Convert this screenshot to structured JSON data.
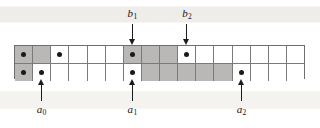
{
  "figure": {
    "name": "two-row-cell-array-with-pointers",
    "grid": {
      "columns": 16,
      "rows": 2,
      "shade_color": "#b9b8b6",
      "cell_color": "#ffffff",
      "border_color": "#6e6e6e",
      "dot_color": "#1a1a1a",
      "top_row": [
        {
          "index": 0,
          "shaded": true,
          "dot": true
        },
        {
          "index": 1,
          "shaded": true,
          "dot": false
        },
        {
          "index": 2,
          "shaded": false,
          "dot": true
        },
        {
          "index": 3,
          "shaded": false,
          "dot": false
        },
        {
          "index": 4,
          "shaded": false,
          "dot": false
        },
        {
          "index": 5,
          "shaded": false,
          "dot": false
        },
        {
          "index": 6,
          "shaded": true,
          "dot": true
        },
        {
          "index": 7,
          "shaded": true,
          "dot": false
        },
        {
          "index": 8,
          "shaded": true,
          "dot": false
        },
        {
          "index": 9,
          "shaded": false,
          "dot": true
        },
        {
          "index": 10,
          "shaded": false,
          "dot": false
        },
        {
          "index": 11,
          "shaded": false,
          "dot": false
        },
        {
          "index": 12,
          "shaded": false,
          "dot": false
        },
        {
          "index": 13,
          "shaded": false,
          "dot": false
        },
        {
          "index": 14,
          "shaded": false,
          "dot": false
        },
        {
          "index": 15,
          "shaded": false,
          "dot": false
        }
      ],
      "bottom_row": [
        {
          "index": 0,
          "shaded": true,
          "dot": true
        },
        {
          "index": 1,
          "shaded": false,
          "dot": true
        },
        {
          "index": 2,
          "shaded": false,
          "dot": false
        },
        {
          "index": 3,
          "shaded": false,
          "dot": false
        },
        {
          "index": 4,
          "shaded": false,
          "dot": false
        },
        {
          "index": 5,
          "shaded": false,
          "dot": false
        },
        {
          "index": 6,
          "shaded": false,
          "dot": true
        },
        {
          "index": 7,
          "shaded": true,
          "dot": false
        },
        {
          "index": 8,
          "shaded": true,
          "dot": false
        },
        {
          "index": 9,
          "shaded": true,
          "dot": false
        },
        {
          "index": 10,
          "shaded": true,
          "dot": false
        },
        {
          "index": 11,
          "shaded": true,
          "dot": false
        },
        {
          "index": 12,
          "shaded": false,
          "dot": true
        },
        {
          "index": 13,
          "shaded": false,
          "dot": false
        },
        {
          "index": 14,
          "shaded": false,
          "dot": false
        },
        {
          "index": 15,
          "shaded": false,
          "dot": false
        }
      ]
    },
    "top_markers": [
      {
        "id": "b1",
        "base": "b",
        "sub": "1",
        "column": 6,
        "direction": "down"
      },
      {
        "id": "b2",
        "base": "b",
        "sub": "2",
        "column": 9,
        "direction": "down"
      }
    ],
    "bottom_markers": [
      {
        "id": "a0",
        "base": "a",
        "sub": "0",
        "column": 1,
        "direction": "up"
      },
      {
        "id": "a1",
        "base": "a",
        "sub": "1",
        "column": 6,
        "direction": "up"
      },
      {
        "id": "a2",
        "base": "a",
        "sub": "2",
        "column": 12,
        "direction": "up"
      }
    ]
  }
}
